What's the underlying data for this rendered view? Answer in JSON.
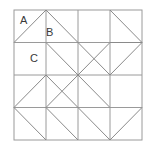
{
  "figure": {
    "type": "diagram",
    "canvas": {
      "width": 154,
      "height": 147
    },
    "background_color": "#ffffff",
    "line_color": "#8a8a8a",
    "frame_color": "#9a9a9a",
    "label_color": "#3a3a3a",
    "line_width": 1
  },
  "grid": {
    "rows": 4,
    "cols": 4,
    "x0": 14,
    "y0": 10,
    "cell_w": 32,
    "cell_h": 32.5,
    "x_lines": [
      14,
      46,
      78,
      110,
      142
    ],
    "y_lines": [
      10,
      42.5,
      75,
      107.5,
      140
    ],
    "center": {
      "x": 78,
      "y": 75
    }
  },
  "labels": [
    {
      "id": "label-a",
      "text": "A",
      "x": 20,
      "y": 24
    },
    {
      "id": "label-b",
      "text": "B",
      "x": 46,
      "y": 36
    },
    {
      "id": "label-c",
      "text": "C",
      "x": 30,
      "y": 62
    }
  ],
  "frame": {
    "x": 14,
    "y": 10,
    "width": 128,
    "height": 130
  },
  "grid_lines": [
    {
      "id": "v-line-1",
      "x1": 46,
      "y1": 10,
      "x2": 46,
      "y2": 140
    },
    {
      "id": "v-line-2",
      "x1": 78,
      "y1": 10,
      "x2": 78,
      "y2": 140
    },
    {
      "id": "v-line-3",
      "x1": 110,
      "y1": 10,
      "x2": 110,
      "y2": 140
    },
    {
      "id": "h-line-1",
      "x1": 14,
      "y1": 42.5,
      "x2": 142,
      "y2": 42.5
    },
    {
      "id": "h-line-2",
      "x1": 14,
      "y1": 75,
      "x2": 142,
      "y2": 75
    },
    {
      "id": "h-line-3",
      "x1": 14,
      "y1": 107.5,
      "x2": 142,
      "y2": 107.5
    }
  ],
  "diagonals": [
    {
      "id": "diag-top-left-up",
      "x1": 14,
      "y1": 42.5,
      "x2": 46,
      "y2": 10
    },
    {
      "id": "diag-top-peak-down",
      "x1": 46,
      "y1": 10,
      "x2": 78,
      "y2": 42.5
    },
    {
      "id": "diag-top-right-cell",
      "x1": 110,
      "y1": 10,
      "x2": 142,
      "y2": 42.5
    },
    {
      "id": "diag-right-upper-in",
      "x1": 110,
      "y1": 42.5,
      "x2": 142,
      "y2": 42.5
    },
    {
      "id": "diag-r2-c2-down",
      "x1": 46,
      "y1": 42.5,
      "x2": 78,
      "y2": 75
    },
    {
      "id": "diag-r2-c3-up",
      "x1": 78,
      "y1": 75,
      "x2": 110,
      "y2": 42.5
    },
    {
      "id": "diag-r2-c3-down",
      "x1": 78,
      "y1": 42.5,
      "x2": 110,
      "y2": 75
    },
    {
      "id": "diag-r2-c4-up",
      "x1": 110,
      "y1": 75,
      "x2": 142,
      "y2": 42.5
    },
    {
      "id": "diag-r3-c1-up",
      "x1": 14,
      "y1": 107.5,
      "x2": 46,
      "y2": 75
    },
    {
      "id": "diag-r3-c1-down",
      "x1": 14,
      "y1": 107.5,
      "x2": 46,
      "y2": 140
    },
    {
      "id": "diag-r3-c2-up",
      "x1": 46,
      "y1": 107.5,
      "x2": 78,
      "y2": 75
    },
    {
      "id": "diag-r3-c2-down",
      "x1": 46,
      "y1": 75,
      "x2": 78,
      "y2": 107.5
    },
    {
      "id": "diag-r3-c3-down",
      "x1": 78,
      "y1": 107.5,
      "x2": 110,
      "y2": 140
    },
    {
      "id": "diag-r3-c4-up",
      "x1": 110,
      "y1": 140,
      "x2": 142,
      "y2": 107.5
    },
    {
      "id": "diag-center-ne",
      "x1": 78,
      "y1": 75,
      "x2": 110,
      "y2": 107.5
    },
    {
      "id": "diag-bottom-left-v",
      "x1": 46,
      "y1": 107.5,
      "x2": 78,
      "y2": 140
    }
  ],
  "shapes": {
    "top_large_triangle": "apex at top-center of columns 1-2, base along first horizontal line",
    "left_arrow_triangle": "points left, apex on left frame edge at row 3",
    "right_arrow_triangle": "points right, apex on right frame edge at row 2",
    "bottom_arrow_triangle": "points down, apex on bottom frame edge at column 3",
    "center_pinwheel": "four diagonals meeting at center point"
  }
}
